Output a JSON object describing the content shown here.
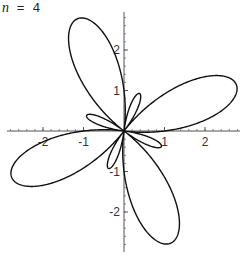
{
  "title": {
    "variable": "n",
    "equals": " = ",
    "value": "4"
  },
  "colors": {
    "curve": "#111111",
    "axis": "#555555",
    "background": "#ffffff"
  },
  "chart_data": {
    "type": "line",
    "subtype": "polar",
    "title": "n = 4",
    "equation": "r = 1 + 2 sin(n θ)",
    "n": 4,
    "theta_range": [
      0,
      6.283185307
    ],
    "xlabel": "",
    "ylabel": "",
    "xlim": [
      -2.9,
      2.9
    ],
    "ylim": [
      -3.0,
      2.95
    ],
    "x_ticks": [
      {
        "value": -2,
        "label": "-2"
      },
      {
        "value": -1,
        "label": "-1"
      },
      {
        "value": 1,
        "label": "1"
      },
      {
        "value": 2,
        "label": "2"
      }
    ],
    "y_ticks": [
      {
        "value": 2,
        "label": "2"
      },
      {
        "value": 1,
        "label": "1"
      },
      {
        "value": -1,
        "label": "-1"
      },
      {
        "value": -2,
        "label": "-2"
      }
    ],
    "minor_tick_step": 0.2,
    "grid": false,
    "legend": null,
    "features": {
      "large_lobes": [
        {
          "direction_deg": 22.5,
          "tip": [
            2.77,
            1.15
          ]
        },
        {
          "direction_deg": 112.5,
          "tip": [
            -1.15,
            2.77
          ]
        },
        {
          "direction_deg": 202.5,
          "tip": [
            -2.77,
            -1.15
          ]
        },
        {
          "direction_deg": 292.5,
          "tip": [
            1.15,
            -2.77
          ]
        }
      ],
      "small_lobes": [
        {
          "direction_deg": 67.5,
          "tip": [
            0.38,
            0.92
          ]
        },
        {
          "direction_deg": 157.5,
          "tip": [
            -0.92,
            0.38
          ]
        },
        {
          "direction_deg": 247.5,
          "tip": [
            -0.38,
            -0.92
          ]
        },
        {
          "direction_deg": 337.5,
          "tip": [
            0.92,
            -0.38
          ]
        }
      ]
    },
    "layout": {
      "origin_px": [
        124,
        131
      ],
      "px_per_unit": 40.5,
      "x_axis_px": [
        7,
        240
      ],
      "y_axis_px": [
        12,
        252
      ]
    }
  }
}
